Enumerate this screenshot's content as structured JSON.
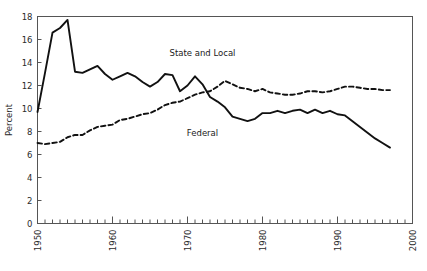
{
  "chart_data": {
    "type": "line",
    "title": "",
    "xlabel": "",
    "ylabel": "Percent",
    "xlim": [
      1950,
      2000
    ],
    "ylim": [
      0,
      18
    ],
    "yticks": [
      0,
      2,
      4,
      6,
      8,
      10,
      12,
      14,
      16,
      18
    ],
    "ytick_labels": [
      "0",
      "2",
      "4",
      "6",
      "8",
      "10",
      "12",
      "14",
      "16",
      "18"
    ],
    "xticks": [
      1950,
      1960,
      1970,
      1980,
      1990,
      2000
    ],
    "xtick_labels": [
      "1950",
      "1960",
      "1970",
      "1980",
      "1990",
      "2000"
    ],
    "xtick_rotation": 90,
    "minor_xtick_interval": 1,
    "grid": false,
    "legend_position": "inline-annotation",
    "x": [
      1950,
      1951,
      1952,
      1953,
      1954,
      1955,
      1956,
      1957,
      1958,
      1959,
      1960,
      1961,
      1962,
      1963,
      1964,
      1965,
      1966,
      1967,
      1968,
      1969,
      1970,
      1971,
      1972,
      1973,
      1974,
      1975,
      1976,
      1977,
      1978,
      1979,
      1980,
      1981,
      1982,
      1983,
      1984,
      1985,
      1986,
      1987,
      1988,
      1989,
      1990,
      1991,
      1992,
      1993,
      1994,
      1995,
      1996,
      1997
    ],
    "series": [
      {
        "name": "Federal",
        "style": "solid",
        "color": "#111111",
        "label_x": 1972,
        "label_y": 7.6,
        "values": [
          9.7,
          13.1,
          16.6,
          17.0,
          17.7,
          13.2,
          13.1,
          13.4,
          13.7,
          13.0,
          12.5,
          12.8,
          13.1,
          12.8,
          12.3,
          11.9,
          12.3,
          13.0,
          12.9,
          11.5,
          12.0,
          12.8,
          12.1,
          11.0,
          10.6,
          10.1,
          9.3,
          9.1,
          8.9,
          9.1,
          9.6,
          9.6,
          9.8,
          9.6,
          9.8,
          9.9,
          9.6,
          9.9,
          9.6,
          9.8,
          9.5,
          9.4,
          8.9,
          8.4,
          7.9,
          7.4,
          7.0,
          6.6
        ]
      },
      {
        "name": "State and Local",
        "style": "dashed",
        "color": "#111111",
        "label_x": 1972,
        "label_y": 14.6,
        "values": [
          7.0,
          6.9,
          7.0,
          7.1,
          7.5,
          7.7,
          7.7,
          8.1,
          8.4,
          8.5,
          8.6,
          9.0,
          9.1,
          9.3,
          9.5,
          9.6,
          9.9,
          10.3,
          10.5,
          10.6,
          10.9,
          11.2,
          11.4,
          11.5,
          11.9,
          12.4,
          12.1,
          11.8,
          11.7,
          11.5,
          11.7,
          11.4,
          11.3,
          11.2,
          11.2,
          11.3,
          11.5,
          11.5,
          11.4,
          11.5,
          11.7,
          11.9,
          11.9,
          11.8,
          11.7,
          11.7,
          11.6,
          11.6
        ]
      }
    ]
  },
  "axis": {
    "y_title": "Percent"
  },
  "annotations": {
    "federal": "Federal",
    "state_and_local": "State and Local"
  }
}
